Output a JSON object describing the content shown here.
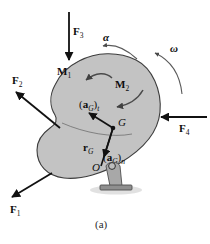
{
  "figure": {
    "caption": "(a)",
    "kind": "free-body-diagram",
    "background_color": "#ffffff",
    "body": {
      "fill_color": "#c3c3c3",
      "outline_color": "#3d3d3d",
      "shadow_color": "#d9d9d9"
    }
  },
  "forces": [
    {
      "id": "F1",
      "base": "F",
      "sub": "1",
      "direction": "down-left"
    },
    {
      "id": "F2",
      "base": "F",
      "sub": "2",
      "direction": "up-left"
    },
    {
      "id": "F3",
      "base": "F",
      "sub": "3",
      "direction": "down"
    },
    {
      "id": "F4",
      "base": "F",
      "sub": "4",
      "direction": "left"
    }
  ],
  "moments": [
    {
      "id": "M1",
      "base": "M",
      "sub": "1",
      "sense": "counterclockwise"
    },
    {
      "id": "M2",
      "base": "M",
      "sub": "2",
      "sense": "counterclockwise"
    }
  ],
  "kinematics": [
    {
      "id": "alpha",
      "symbol": "α",
      "meaning": "angular-acceleration",
      "sense": "counterclockwise"
    },
    {
      "id": "omega",
      "symbol": "ω",
      "meaning": "angular-velocity",
      "sense": "counterclockwise"
    }
  ],
  "points": [
    {
      "id": "G",
      "label": "G",
      "meaning": "mass-center"
    },
    {
      "id": "O",
      "label": "O",
      "meaning": "pin-support"
    }
  ],
  "vectors": [
    {
      "id": "aGt",
      "base": "a",
      "point_sub": "G",
      "comp_sub": "t",
      "open": "(",
      "close": ")",
      "meaning": "tangential-acceleration-of-G",
      "direction": "up-left"
    },
    {
      "id": "aGn",
      "base": "a",
      "point_sub": "G",
      "comp_sub": "n",
      "open": "(",
      "close": ")",
      "meaning": "normal-acceleration-of-G",
      "direction": "down-toward-O"
    },
    {
      "id": "rG",
      "base": "r",
      "point_sub": "G",
      "comp_sub": "",
      "open": "",
      "close": "",
      "meaning": "position-vector-O-to-G",
      "direction": "from-O-to-G"
    }
  ],
  "support": {
    "type": "pin-support",
    "bracket_color": "#a8a8a8",
    "base_color": "#8f8f8f"
  }
}
